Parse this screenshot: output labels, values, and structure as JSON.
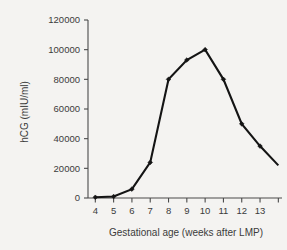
{
  "chart_data": {
    "type": "line",
    "title": "",
    "xlabel": "Gestational age (weeks after LMP)",
    "ylabel": "hCG (mIU/ml)",
    "x": [
      4,
      5,
      6,
      7,
      8,
      9,
      10,
      11,
      12,
      13
    ],
    "values": [
      500,
      1000,
      6000,
      24000,
      80000,
      93000,
      100000,
      80000,
      50000,
      35000
    ],
    "series": [
      {
        "name": "hCG",
        "x": [
          4,
          5,
          6,
          7,
          8,
          9,
          10,
          11,
          12,
          13
        ],
        "values": [
          500,
          1000,
          6000,
          24000,
          80000,
          93000,
          100000,
          80000,
          50000,
          35000
        ]
      }
    ],
    "line_extends_to": {
      "x": 14,
      "y": 22000
    },
    "xlim": [
      3.6,
      14.2
    ],
    "ylim": [
      0,
      120000
    ],
    "xticks": [
      4,
      5,
      6,
      7,
      8,
      9,
      10,
      11,
      12,
      13,
      14
    ],
    "xticklabels": [
      "4",
      "5",
      "6",
      "7",
      "8",
      "9",
      "10",
      "11",
      "12",
      "13",
      ""
    ],
    "yticks": [
      0,
      20000,
      40000,
      60000,
      80000,
      100000,
      120000
    ],
    "yticklabels": [
      "0",
      "20000",
      "40000",
      "60000",
      "80000",
      "100000",
      "120000"
    ],
    "grid": false,
    "legend": null,
    "marker": "dot",
    "line_color": "#141414",
    "background_color": "#f4f3f1",
    "axis_color": "#4a4a4a",
    "text_color": "#3b3b3b"
  },
  "axes": {
    "y_title": "hCG (mIU/ml)",
    "x_title": "Gestational age (weeks after LMP)",
    "y_labels": [
      "120000",
      "100000",
      "80000",
      "60000",
      "40000",
      "20000",
      "0"
    ],
    "x_labels": [
      "4",
      "5",
      "6",
      "7",
      "8",
      "9",
      "10",
      "11",
      "12",
      "13"
    ]
  }
}
